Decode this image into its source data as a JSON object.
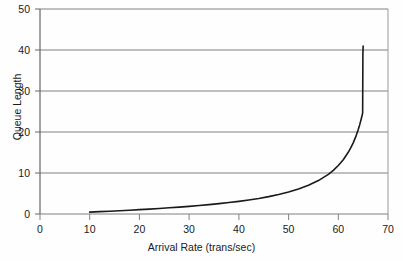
{
  "chart_data": {
    "type": "line",
    "title": "",
    "xlabel": "Arrival Rate (trans/sec)",
    "ylabel": "Queue Length",
    "xlim": [
      0,
      70
    ],
    "ylim": [
      0,
      50
    ],
    "xticks": [
      0,
      10,
      20,
      30,
      40,
      50,
      60,
      70
    ],
    "yticks": [
      0,
      10,
      20,
      30,
      40,
      50
    ],
    "xtick_labels": [
      "0",
      "10",
      "20",
      "30",
      "40",
      "50",
      "60",
      "70"
    ],
    "ytick_labels": [
      "0",
      "10",
      "20",
      "30",
      "40",
      "50"
    ],
    "grid": "horizontal",
    "legend": "none",
    "series": [
      {
        "name": "Queue Length",
        "color": "#1a1a1a",
        "x": [
          10,
          12,
          14,
          16,
          18,
          20,
          22,
          24,
          26,
          28,
          30,
          32,
          34,
          36,
          38,
          40,
          42,
          44,
          46,
          48,
          50,
          52,
          54,
          56,
          58,
          59,
          60,
          61,
          62,
          62.5,
          63,
          63.5,
          64,
          64.3,
          64.6,
          64.8,
          64.9
        ],
        "y": [
          0.45,
          0.57,
          0.68,
          0.8,
          0.93,
          1.06,
          1.2,
          1.35,
          1.51,
          1.68,
          1.86,
          2.06,
          2.28,
          2.52,
          2.79,
          3.08,
          3.42,
          3.8,
          4.24,
          4.75,
          5.36,
          6.09,
          6.99,
          8.15,
          9.67,
          10.65,
          11.82,
          13.25,
          15.05,
          16.12,
          17.36,
          18.8,
          20.53,
          21.73,
          23.09,
          24.08,
          24.6
        ]
      }
    ],
    "colors": {
      "line": "#1a1a1a",
      "gridline": "#808080",
      "axis": "#666666",
      "background": "#fefefe",
      "text": "#1a1a1a"
    },
    "annotations": []
  }
}
